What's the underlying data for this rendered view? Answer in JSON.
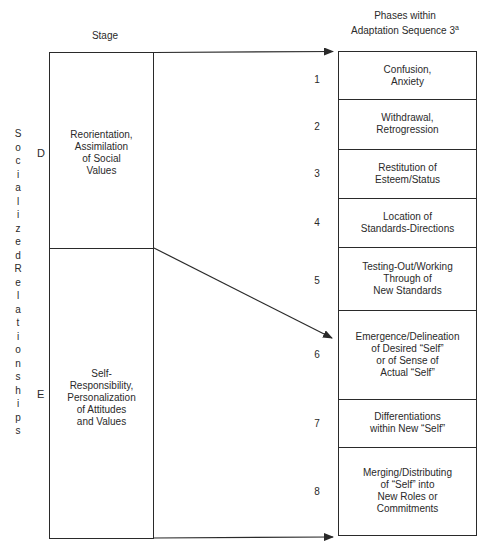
{
  "headers": {
    "stage": "Stage",
    "phases_line1": "Phases within",
    "phases_line2": "Adaptation Sequence 3",
    "phases_sup": "a"
  },
  "side_label": {
    "word1": [
      "S",
      "o",
      "c",
      "i",
      "a",
      "l",
      "i",
      "z",
      "e",
      "d"
    ],
    "word2": [
      "R",
      "e",
      "l",
      "a",
      "t",
      "i",
      "o",
      "n",
      "s",
      "h",
      "i",
      "p",
      "s"
    ],
    "text": "Socialized Relationships"
  },
  "stages": [
    {
      "letter": "D",
      "lines": [
        "Reorientation,",
        "Assimilation",
        "of Social",
        "Values"
      ]
    },
    {
      "letter": "E",
      "lines": [
        "Self-",
        "Responsibility,",
        "Personalization",
        "of Attitudes",
        "and Values"
      ]
    }
  ],
  "phases": [
    {
      "num": "1",
      "lines": [
        "Confusion,",
        "Anxiety"
      ]
    },
    {
      "num": "2",
      "lines": [
        "Withdrawal,",
        "Retrogression"
      ]
    },
    {
      "num": "3",
      "lines": [
        "Restitution of",
        "Esteem/Status"
      ]
    },
    {
      "num": "4",
      "lines": [
        "Location of",
        "Standards-Directions"
      ]
    },
    {
      "num": "5",
      "lines": [
        "Testing-Out/Working",
        "Through of",
        "New Standards"
      ]
    },
    {
      "num": "6",
      "lines": [
        "Emergence/Delineation",
        "of Desired “Self”",
        "or of Sense of",
        "Actual “Self”"
      ]
    },
    {
      "num": "7",
      "lines": [
        "Differentiations",
        "within New “Self”"
      ]
    },
    {
      "num": "8",
      "lines": [
        "Merging/Distributing",
        "of “Self” into",
        "New Roles or",
        "Commitments"
      ]
    }
  ],
  "colors": {
    "ink": "#2a2a2a",
    "background": "#ffffff"
  }
}
